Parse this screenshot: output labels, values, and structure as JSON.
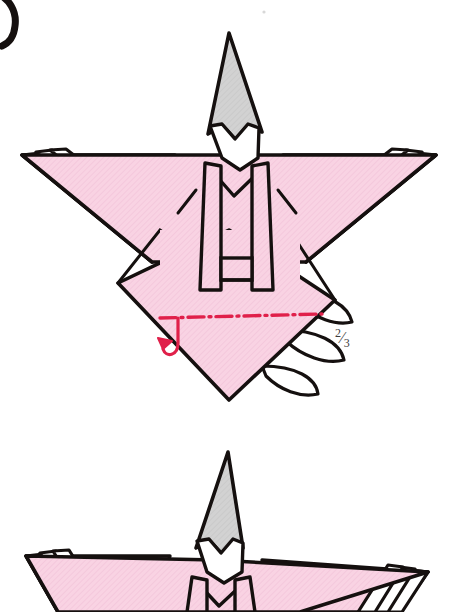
{
  "document": {
    "type": "origami-instruction-diagram",
    "subject": "japanese-paper-doll",
    "background_color": "#ffffff"
  },
  "palette": {
    "paper_pink": "#f9d3e3",
    "paper_pink_shade": "#f2c3d8",
    "hat_gray": "#d2d2d2",
    "face_white": "#ffffff",
    "ink_black": "#15100f",
    "fold_red": "#e0204a",
    "label_gray": "#3c3c3c"
  },
  "step_marker": {
    "name": "step-number-partial",
    "note": "cropped black numeral stroke at top-left corner"
  },
  "annotations": {
    "fraction_label": {
      "numerator": "2",
      "slash": "⁄",
      "denominator": "3",
      "full_text": "2/3",
      "x": 335,
      "y": 326
    },
    "fold_line": {
      "style": "dash-dot",
      "color": "#e0204a",
      "meaning": "valley-fold-line",
      "x1": 160,
      "y1": 318,
      "x2": 320,
      "y2": 315
    },
    "fold_arrow": {
      "style": "curved-hook",
      "color": "#e0204a",
      "meaning": "fold-up",
      "x": 170,
      "y": 345
    },
    "speck": {
      "x": 264,
      "y": 12
    }
  },
  "figures": [
    {
      "id": "figure-1",
      "label": "doll-before-fold",
      "center_x": 229,
      "hat": {
        "name": "conical-hat",
        "color": "#d2d2d2",
        "apex_y": 33
      },
      "face": {
        "name": "doll-face",
        "color": "#ffffff"
      },
      "body": {
        "name": "kimono-body",
        "color": "#f9d3e3"
      },
      "obi": {
        "name": "obi-sash"
      },
      "wings": {
        "layers": 3,
        "name": "folded-sleeve-layers"
      },
      "skirt": {
        "name": "lower-diamond-skirt"
      },
      "white_flaps": {
        "count": 2,
        "name": "white-under-layers"
      }
    },
    {
      "id": "figure-2",
      "label": "doll-after-fold-cropped",
      "center_x": 215,
      "hat": {
        "name": "conical-hat",
        "color": "#d2d2d2",
        "apex_y": 452
      },
      "face": {
        "name": "doll-face",
        "color": "#ffffff"
      },
      "body": {
        "name": "kimono-body",
        "color": "#f9d3e3"
      },
      "wings": {
        "layers": 3,
        "name": "folded-sleeve-layers"
      },
      "cropped": "bottom"
    }
  ]
}
